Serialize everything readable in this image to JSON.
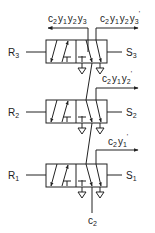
{
  "diagram": {
    "type": "pneumatic valve cascade",
    "stroke_color": "#222222",
    "background": "#ffffff",
    "top_outputs": {
      "left": {
        "text": "c2y1y2y3",
        "parts": [
          "c",
          "2",
          "y",
          "1",
          "y",
          "2",
          "y",
          "3"
        ],
        "direction": "left"
      },
      "right": {
        "text": "c2y1y2y3'",
        "parts": [
          "c",
          "2",
          "y",
          "1",
          "y",
          "2",
          "y",
          "3",
          "'"
        ],
        "direction": "right"
      }
    },
    "valves": [
      {
        "id": "valve-3",
        "reset": {
          "base": "R",
          "sub": "3"
        },
        "set": {
          "base": "S",
          "sub": "3"
        },
        "tap_label": {
          "text": "c2y1y2'",
          "parts": [
            "c",
            "2",
            "y",
            "1",
            "y",
            "2",
            "'"
          ]
        }
      },
      {
        "id": "valve-2",
        "reset": {
          "base": "R",
          "sub": "2"
        },
        "set": {
          "base": "S",
          "sub": "2"
        },
        "tap_label": {
          "text": "c2y1'",
          "parts": [
            "c",
            "2",
            "y",
            "1",
            "'"
          ]
        }
      },
      {
        "id": "valve-1",
        "reset": {
          "base": "R",
          "sub": "1"
        },
        "set": {
          "base": "S",
          "sub": "1"
        }
      }
    ],
    "input": {
      "text": "c2",
      "base": "c",
      "sub": "2"
    }
  }
}
